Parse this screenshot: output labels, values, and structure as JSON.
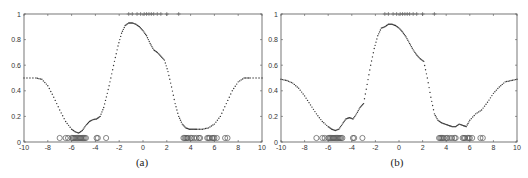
{
  "chart_data": [
    {
      "id": "a",
      "type": "scatter",
      "title": "",
      "caption": "(a)",
      "xlabel": "",
      "ylabel": "",
      "xlim": [
        -10,
        10
      ],
      "ylim": [
        0,
        1
      ],
      "xticks": [
        -10,
        -8,
        -6,
        -4,
        -2,
        0,
        2,
        4,
        6,
        8,
        10
      ],
      "yticks": [
        0,
        0.2,
        0.4,
        0.6,
        0.8,
        1
      ],
      "grid": false,
      "curve": {
        "name": "predictive probability",
        "style": "dotted",
        "x": [
          -10,
          -9,
          -8.5,
          -8,
          -7.5,
          -7,
          -6.5,
          -6,
          -5.7,
          -5.4,
          -5.1,
          -4.8,
          -4.5,
          -4.2,
          -3.9,
          -3.6,
          -3.3,
          -3,
          -2.7,
          -2.4,
          -2.1,
          -1.8,
          -1.5,
          -1.2,
          -0.9,
          -0.6,
          -0.3,
          0,
          0.3,
          0.6,
          0.9,
          1.2,
          1.5,
          1.8,
          2.1,
          2.4,
          2.7,
          3,
          3.3,
          3.6,
          3.9,
          4.2,
          4.5,
          5,
          5.5,
          6,
          6.5,
          7,
          7.5,
          8,
          8.5,
          9,
          10
        ],
        "y": [
          0.5,
          0.5,
          0.49,
          0.44,
          0.35,
          0.25,
          0.16,
          0.1,
          0.08,
          0.07,
          0.09,
          0.13,
          0.16,
          0.175,
          0.18,
          0.2,
          0.27,
          0.38,
          0.5,
          0.63,
          0.75,
          0.85,
          0.91,
          0.93,
          0.93,
          0.92,
          0.9,
          0.87,
          0.83,
          0.77,
          0.72,
          0.7,
          0.67,
          0.64,
          0.55,
          0.43,
          0.3,
          0.2,
          0.14,
          0.11,
          0.1,
          0.1,
          0.1,
          0.1,
          0.11,
          0.14,
          0.2,
          0.3,
          0.4,
          0.47,
          0.5,
          0.5,
          0.5
        ]
      },
      "class0_points_x": [
        -7.0,
        -6.5,
        -6.3,
        -6.0,
        -5.9,
        -5.8,
        -5.7,
        -5.6,
        -5.5,
        -5.4,
        -5.3,
        -5.2,
        -5.1,
        -5.0,
        -4.9,
        -4.8,
        -3.9,
        -3.8,
        -3.1,
        3.4,
        3.5,
        3.6,
        3.7,
        3.8,
        4.0,
        4.1,
        4.3,
        4.5,
        4.7,
        4.8,
        5.4,
        5.5,
        5.6,
        5.8,
        5.9,
        6.0,
        6.2,
        6.9,
        7.1
      ],
      "class1_points_x": [
        -1.2,
        -0.9,
        -0.5,
        -0.2,
        0.1,
        0.3,
        0.5,
        0.7,
        0.9,
        1.2,
        1.5,
        2.0,
        3.0
      ]
    },
    {
      "id": "b",
      "type": "scatter",
      "title": "",
      "caption": "(b)",
      "xlabel": "",
      "ylabel": "",
      "xlim": [
        -10,
        10
      ],
      "ylim": [
        0,
        1
      ],
      "xticks": [
        -10,
        -8,
        -6,
        -4,
        -2,
        0,
        2,
        4,
        6,
        8,
        10
      ],
      "yticks": [
        0,
        0.2,
        0.4,
        0.6,
        0.8,
        1
      ],
      "grid": false,
      "curve": {
        "name": "predictive probability",
        "style": "dotted",
        "x": [
          -10,
          -9.5,
          -9,
          -8.5,
          -8,
          -7.5,
          -7,
          -6.5,
          -6,
          -5.7,
          -5.4,
          -5.1,
          -4.8,
          -4.5,
          -4.2,
          -3.9,
          -3.6,
          -3.3,
          -3,
          -2.7,
          -2.4,
          -2.1,
          -1.8,
          -1.5,
          -1.2,
          -0.9,
          -0.6,
          -0.3,
          0,
          0.3,
          0.6,
          0.9,
          1.2,
          1.5,
          1.8,
          2.1,
          2.4,
          2.7,
          3,
          3.3,
          3.6,
          3.9,
          4.2,
          4.5,
          4.8,
          5.1,
          5.4,
          5.7,
          6,
          6.5,
          7,
          7.5,
          8,
          8.5,
          9,
          9.5,
          10
        ],
        "y": [
          0.49,
          0.48,
          0.46,
          0.42,
          0.36,
          0.29,
          0.22,
          0.16,
          0.12,
          0.1,
          0.09,
          0.1,
          0.14,
          0.18,
          0.19,
          0.18,
          0.22,
          0.27,
          0.3,
          0.45,
          0.6,
          0.73,
          0.83,
          0.89,
          0.9,
          0.92,
          0.92,
          0.91,
          0.89,
          0.86,
          0.82,
          0.77,
          0.72,
          0.68,
          0.65,
          0.63,
          0.5,
          0.35,
          0.22,
          0.17,
          0.15,
          0.14,
          0.13,
          0.12,
          0.12,
          0.14,
          0.13,
          0.12,
          0.17,
          0.22,
          0.25,
          0.31,
          0.38,
          0.43,
          0.47,
          0.48,
          0.49
        ]
      },
      "class0_points_x": [
        -7.0,
        -6.5,
        -6.3,
        -6.0,
        -5.9,
        -5.8,
        -5.7,
        -5.6,
        -5.5,
        -5.4,
        -5.3,
        -5.2,
        -5.1,
        -5.0,
        -4.9,
        -4.8,
        -3.9,
        -3.8,
        -3.1,
        3.4,
        3.5,
        3.6,
        3.7,
        3.8,
        4.0,
        4.1,
        4.3,
        4.5,
        4.7,
        4.8,
        5.4,
        5.5,
        5.6,
        5.8,
        5.9,
        6.0,
        6.2,
        6.9,
        7.1
      ],
      "class1_points_x": [
        -1.2,
        -0.9,
        -0.5,
        -0.2,
        0.1,
        0.3,
        0.5,
        0.7,
        0.9,
        1.2,
        1.5,
        2.0,
        3.0
      ]
    }
  ],
  "layout": {
    "panels": [
      {
        "left": 24,
        "right": 262,
        "top": 14,
        "bottom": 142,
        "caption_x": 142,
        "caption_y": 166
      },
      {
        "left": 281,
        "right": 517,
        "top": 14,
        "bottom": 142,
        "caption_x": 397,
        "caption_y": 166
      }
    ],
    "colors": {
      "axis": "#555555",
      "curve": "#333333",
      "marker": "#555555"
    }
  }
}
